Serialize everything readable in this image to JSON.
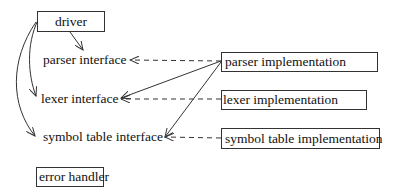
{
  "diagram": {
    "type": "module dependency diagram",
    "nodes": [
      {
        "id": "driver",
        "label": "driver",
        "boxed": true
      },
      {
        "id": "parser_interface",
        "label": "parser interface",
        "boxed": false
      },
      {
        "id": "lexer_interface",
        "label": "lexer interface",
        "boxed": false
      },
      {
        "id": "symbol_table_interface",
        "label": "symbol table interface",
        "boxed": false
      },
      {
        "id": "error_handler",
        "label": "error handler",
        "boxed": true
      },
      {
        "id": "parser_implementation",
        "label": "parser implementation",
        "boxed": true
      },
      {
        "id": "lexer_implementation",
        "label": "lexer implementation",
        "boxed": true
      },
      {
        "id": "symbol_table_implementation",
        "label": "symbol table implementation",
        "boxed": true
      }
    ],
    "edges": [
      {
        "from": "driver",
        "to": "parser_interface",
        "style": "solid"
      },
      {
        "from": "driver",
        "to": "lexer_interface",
        "style": "solid"
      },
      {
        "from": "driver",
        "to": "symbol_table_interface",
        "style": "solid"
      },
      {
        "from": "parser_implementation",
        "to": "lexer_interface",
        "style": "solid"
      },
      {
        "from": "parser_implementation",
        "to": "symbol_table_interface",
        "style": "solid"
      },
      {
        "from": "parser_implementation",
        "to": "parser_interface",
        "style": "dashed"
      },
      {
        "from": "lexer_implementation",
        "to": "lexer_interface",
        "style": "dashed"
      },
      {
        "from": "symbol_table_implementation",
        "to": "symbol_table_interface",
        "style": "dashed"
      }
    ],
    "colors": {
      "line": "#333333",
      "text": "#111111",
      "background": "#ffffff"
    }
  }
}
